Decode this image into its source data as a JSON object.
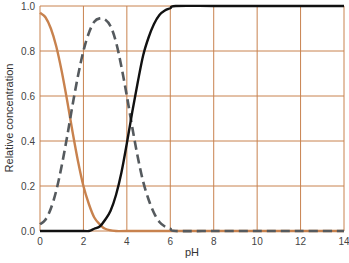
{
  "chart_data": {
    "type": "line",
    "title": "",
    "xlabel": "pH",
    "ylabel": "Relative concentration",
    "xlim": [
      0,
      14
    ],
    "ylim": [
      0.0,
      1.0
    ],
    "x_ticks": [
      "0",
      "2",
      "4",
      "6",
      "8",
      "10",
      "12",
      "14"
    ],
    "y_ticks": [
      "0.0",
      "0.2",
      "0.4",
      "0.6",
      "0.8",
      "1.0"
    ],
    "grid": true,
    "legend": null,
    "series": [
      {
        "name": "orange-solid",
        "color": "#c8824e",
        "style": "solid",
        "x": [
          0,
          0.25,
          0.5,
          0.75,
          1.0,
          1.25,
          1.5,
          1.75,
          2.0,
          2.25,
          2.5,
          2.75,
          3.0,
          3.5,
          4,
          6,
          8,
          10,
          12,
          14
        ],
        "y": [
          0.97,
          0.95,
          0.9,
          0.82,
          0.71,
          0.58,
          0.44,
          0.31,
          0.2,
          0.12,
          0.06,
          0.03,
          0.01,
          0.0,
          0.0,
          0.0,
          0.0,
          0.0,
          0.0,
          0.0
        ]
      },
      {
        "name": "gray-dashed",
        "color": "#555a5e",
        "style": "dashed",
        "x": [
          0,
          0.25,
          0.5,
          0.75,
          1.0,
          1.25,
          1.5,
          1.75,
          2.0,
          2.25,
          2.5,
          2.75,
          3.0,
          3.25,
          3.5,
          3.75,
          4.0,
          4.25,
          4.5,
          4.75,
          5.0,
          5.25,
          5.5,
          5.75,
          6.0,
          6.25,
          8,
          10,
          12,
          14
        ],
        "y": [
          0.03,
          0.05,
          0.1,
          0.18,
          0.29,
          0.42,
          0.56,
          0.69,
          0.8,
          0.88,
          0.93,
          0.945,
          0.94,
          0.91,
          0.84,
          0.73,
          0.6,
          0.46,
          0.33,
          0.22,
          0.14,
          0.08,
          0.04,
          0.02,
          0.01,
          0.0,
          0.0,
          0.0,
          0.0,
          0.0
        ]
      },
      {
        "name": "black-solid",
        "color": "#111111",
        "style": "solid",
        "x": [
          0,
          1,
          2,
          2.25,
          2.5,
          2.75,
          3.0,
          3.25,
          3.5,
          3.75,
          4.0,
          4.25,
          4.5,
          4.75,
          5.0,
          5.25,
          5.5,
          5.75,
          6.0,
          6.25,
          8,
          10,
          12,
          14
        ],
        "y": [
          0.0,
          0.0,
          0.0,
          0.0,
          0.01,
          0.02,
          0.05,
          0.09,
          0.16,
          0.26,
          0.39,
          0.53,
          0.66,
          0.78,
          0.86,
          0.92,
          0.96,
          0.98,
          0.99,
          1.0,
          1.0,
          1.0,
          1.0,
          1.0
        ]
      }
    ]
  },
  "colors": {
    "grid": "#c8824e",
    "background": "#ffffff"
  }
}
